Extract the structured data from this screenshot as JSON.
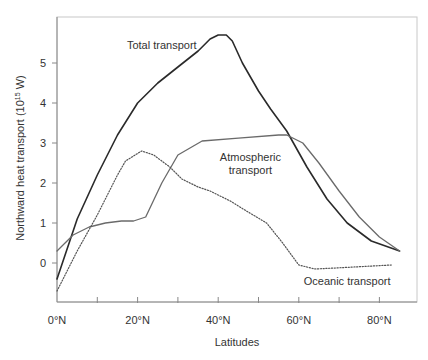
{
  "chart_data": {
    "type": "line",
    "title": "",
    "xlabel": "Latitudes",
    "ylabel": "Northward heat transport (10^15 W)",
    "ylabel_base": "Northward heat transport (10",
    "ylabel_sup": "15",
    "ylabel_tail": " W)",
    "xlim": [
      0,
      88
    ],
    "ylim": [
      -0.97,
      6.0
    ],
    "x_ticks": [
      0,
      10,
      20,
      30,
      40,
      50,
      60,
      70,
      80
    ],
    "x_tick_labels": [
      {
        "value": 0,
        "label": "0°N"
      },
      {
        "value": 20,
        "label": "20°N"
      },
      {
        "value": 40,
        "label": "40°N"
      },
      {
        "value": 60,
        "label": "60°N"
      },
      {
        "value": 80,
        "label": "80°N"
      }
    ],
    "y_ticks": [
      0,
      1,
      2,
      3,
      4,
      5
    ],
    "grid": false,
    "legend_position": "inline annotations",
    "series": [
      {
        "name": "Total transport",
        "style": "solid-dark",
        "label_lines": [
          "Total transport"
        ],
        "label_pos": {
          "x": 26,
          "y": 5.35
        },
        "points": [
          [
            0,
            -0.4
          ],
          [
            5,
            1.1
          ],
          [
            10,
            2.2
          ],
          [
            15,
            3.2
          ],
          [
            20,
            4.0
          ],
          [
            25,
            4.5
          ],
          [
            30,
            4.9
          ],
          [
            35,
            5.3
          ],
          [
            38,
            5.6
          ],
          [
            40,
            5.7
          ],
          [
            42,
            5.7
          ],
          [
            43.5,
            5.55
          ],
          [
            46,
            5.0
          ],
          [
            50,
            4.3
          ],
          [
            53,
            3.85
          ],
          [
            57,
            3.3
          ],
          [
            62,
            2.4
          ],
          [
            67,
            1.6
          ],
          [
            72,
            1.0
          ],
          [
            78,
            0.55
          ],
          [
            85,
            0.3
          ]
        ]
      },
      {
        "name": "Atmospheric transport",
        "style": "solid-gray",
        "label_lines": [
          "Atmospheric",
          "transport"
        ],
        "label_pos": {
          "x": 48,
          "y": 2.55
        },
        "points": [
          [
            0,
            0.3
          ],
          [
            4,
            0.7
          ],
          [
            8,
            0.9
          ],
          [
            12,
            1.0
          ],
          [
            16,
            1.05
          ],
          [
            19,
            1.05
          ],
          [
            22,
            1.15
          ],
          [
            26,
            2.0
          ],
          [
            30,
            2.7
          ],
          [
            36,
            3.05
          ],
          [
            45,
            3.12
          ],
          [
            55,
            3.2
          ],
          [
            57,
            3.2
          ],
          [
            61,
            3.0
          ],
          [
            65,
            2.5
          ],
          [
            70,
            1.8
          ],
          [
            75,
            1.15
          ],
          [
            80,
            0.65
          ],
          [
            85,
            0.3
          ]
        ]
      },
      {
        "name": "Oceanic transport",
        "style": "dotted",
        "label_lines": [
          "Oceanic transport"
        ],
        "label_pos": {
          "x": 72,
          "y": -0.55
        },
        "points": [
          [
            0,
            -0.7
          ],
          [
            5,
            0.3
          ],
          [
            10,
            1.2
          ],
          [
            15,
            2.2
          ],
          [
            17,
            2.55
          ],
          [
            21,
            2.8
          ],
          [
            24,
            2.7
          ],
          [
            28,
            2.4
          ],
          [
            31,
            2.1
          ],
          [
            35,
            1.9
          ],
          [
            38,
            1.8
          ],
          [
            43,
            1.55
          ],
          [
            47,
            1.3
          ],
          [
            52,
            1.0
          ],
          [
            56,
            0.5
          ],
          [
            60,
            -0.05
          ],
          [
            64,
            -0.15
          ],
          [
            70,
            -0.12
          ],
          [
            83,
            -0.05
          ]
        ]
      }
    ]
  },
  "colors": {
    "axis": "#888888",
    "total": "#2a2a2a",
    "atmospheric": "#6a6a6a",
    "oceanic": "#555555",
    "text": "#333333"
  }
}
